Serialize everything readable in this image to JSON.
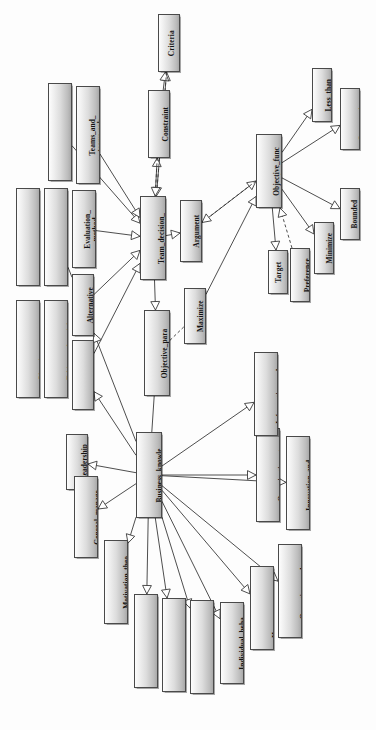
{
  "diagram": {
    "orientation": "rotated-90-ccw",
    "style": {
      "node_border": "#4a4a4a",
      "node_fill_light": "#fdfdfd",
      "node_fill_dark": "#a9a9a9",
      "edge_color": "#3a3a3a",
      "background": "#fdfdfd"
    },
    "expander_glyph": "+",
    "nodes": [
      {
        "id": "criteria",
        "label": "Criteria",
        "x": 158,
        "y": 14,
        "w": 22,
        "h": 58,
        "expander": true
      },
      {
        "id": "constraint",
        "label": "Constraint",
        "x": 148,
        "y": 90,
        "w": 22,
        "h": 68,
        "expander": true
      },
      {
        "id": "strategy",
        "label": "Strategy_and_st\nrategic_managem...",
        "x": 48,
        "y": 83,
        "w": 24,
        "h": 98,
        "expander": true
      },
      {
        "id": "teams",
        "label": "Teams_and_\nteamwork",
        "x": 76,
        "y": 86,
        "w": 24,
        "h": 98,
        "expander": true
      },
      {
        "id": "communication",
        "label": "Communication_\nand_collaboration...",
        "x": 16,
        "y": 188,
        "w": 24,
        "h": 98,
        "expander": true
      },
      {
        "id": "control",
        "label": "Control_processes_\nand_systems",
        "x": 44,
        "y": 188,
        "w": 24,
        "h": 98,
        "expander": true
      },
      {
        "id": "evaluation",
        "label": "Evaluation_\nmethod",
        "x": 72,
        "y": 190,
        "w": 24,
        "h": 78,
        "expander": true
      },
      {
        "id": "planning",
        "label": "Planning_process_\nand_technique...",
        "x": 16,
        "y": 300,
        "w": 24,
        "h": 98,
        "expander": true
      },
      {
        "id": "ethics",
        "label": "Ethics_and_social_\nresponsibil...",
        "x": 44,
        "y": 300,
        "w": 24,
        "h": 98,
        "expander": true
      },
      {
        "id": "alternative",
        "label": "Alternative",
        "x": 72,
        "y": 274,
        "w": 22,
        "h": 62,
        "expander": true
      },
      {
        "id": "related_models",
        "label": "Related_models",
        "x": 72,
        "y": 340,
        "w": 22,
        "h": 70,
        "expander": true
      },
      {
        "id": "team_decision",
        "label": "Team_decision_\nmaking",
        "x": 140,
        "y": 196,
        "w": 26,
        "h": 84,
        "expander": false
      },
      {
        "id": "argument",
        "label": "Argument",
        "x": 180,
        "y": 200,
        "w": 22,
        "h": 62,
        "expander": true
      },
      {
        "id": "objective_param",
        "label": "Objective_para\nmeter",
        "x": 144,
        "y": 310,
        "w": 26,
        "h": 86,
        "expander": true
      },
      {
        "id": "maximize",
        "label": "Maximize",
        "x": 184,
        "y": 288,
        "w": 22,
        "h": 56,
        "expander": true
      },
      {
        "id": "objective_func",
        "label": "Objective_func\ntion",
        "x": 256,
        "y": 134,
        "w": 26,
        "h": 74,
        "expander": false
      },
      {
        "id": "less_than",
        "label": "Less_than",
        "x": 312,
        "y": 68,
        "w": 20,
        "h": 54,
        "expander": false
      },
      {
        "id": "greater_than",
        "label": "Greater_than",
        "x": 340,
        "y": 88,
        "w": 20,
        "h": 62,
        "expander": false
      },
      {
        "id": "bounded",
        "label": "Bounded",
        "x": 340,
        "y": 188,
        "w": 20,
        "h": 52,
        "expander": false
      },
      {
        "id": "minimize",
        "label": "Minimize",
        "x": 314,
        "y": 222,
        "w": 20,
        "h": 52,
        "expander": false
      },
      {
        "id": "target",
        "label": "Target",
        "x": 268,
        "y": 250,
        "w": 20,
        "h": 44,
        "expander": false
      },
      {
        "id": "preference",
        "label": "Preference",
        "x": 290,
        "y": 248,
        "w": 20,
        "h": 54,
        "expander": true
      },
      {
        "id": "business",
        "label": "Business_knowle\ndge",
        "x": 136,
        "y": 432,
        "w": 26,
        "h": 86,
        "expander": false
      },
      {
        "id": "leadership",
        "label": "Leadership",
        "x": 66,
        "y": 434,
        "w": 22,
        "h": 56,
        "expander": true
      },
      {
        "id": "general_mgmt",
        "label": "General_manage\nment",
        "x": 74,
        "y": 476,
        "w": 24,
        "h": 82,
        "expander": true
      },
      {
        "id": "motivation",
        "label": "Motivation_theo\nry_and_practice",
        "x": 104,
        "y": 540,
        "w": 24,
        "h": 84,
        "expander": true
      },
      {
        "id": "mgmt_learning",
        "label": "Management_learning_\npast_&_pre...",
        "x": 134,
        "y": 594,
        "w": 24,
        "h": 94,
        "expander": true
      },
      {
        "id": "global_dim",
        "label": "Global_dimensions_\nof_management...",
        "x": 162,
        "y": 598,
        "w": 24,
        "h": 94,
        "expander": true
      },
      {
        "id": "environmental",
        "label": "Environmental_and_\norganization...",
        "x": 190,
        "y": 600,
        "w": 24,
        "h": 94,
        "expander": true
      },
      {
        "id": "individual",
        "label": "Individual_beha\nvior",
        "x": 220,
        "y": 602,
        "w": 24,
        "h": 82,
        "expander": true
      },
      {
        "id": "human_resource",
        "label": "Human_resource_\nmanagement",
        "x": 250,
        "y": 566,
        "w": 24,
        "h": 84,
        "expander": true
      },
      {
        "id": "operations",
        "label": "Operations_and_\nservices_manage...",
        "x": 278,
        "y": 544,
        "w": 24,
        "h": 94,
        "expander": true
      },
      {
        "id": "organization_st",
        "label": "Organization_st\nructures_and_de...",
        "x": 256,
        "y": 428,
        "w": 24,
        "h": 94,
        "expander": true
      },
      {
        "id": "innovation",
        "label": "Innovation_and_\norganizational_...",
        "x": 286,
        "y": 436,
        "w": 24,
        "h": 94,
        "expander": true
      },
      {
        "id": "information",
        "label": "Information_and_\ndecision_makin...",
        "x": 254,
        "y": 352,
        "w": 24,
        "h": 84,
        "expander": true
      }
    ],
    "edges": [
      {
        "from": "team_decision",
        "to": "criteria",
        "kind": "solid",
        "arrow": "hollow-triangle"
      },
      {
        "from": "team_decision",
        "to": "constraint",
        "kind": "solid",
        "arrow": "hollow-triangle"
      },
      {
        "from": "constraint",
        "to": "criteria",
        "kind": "solid",
        "arrow": "hollow-triangle"
      },
      {
        "from": "criteria",
        "to": "team_decision",
        "kind": "dashed",
        "arrow": "hollow-triangle"
      },
      {
        "from": "constraint",
        "to": "team_decision",
        "kind": "dashed",
        "arrow": "hollow-triangle"
      },
      {
        "from": "strategy",
        "to": "team_decision",
        "kind": "solid",
        "arrow": "hollow-triangle"
      },
      {
        "from": "teams",
        "to": "team_decision",
        "kind": "solid",
        "arrow": "hollow-triangle"
      },
      {
        "from": "evaluation",
        "to": "team_decision",
        "kind": "solid",
        "arrow": "hollow-triangle"
      },
      {
        "from": "control",
        "to": "alternative",
        "kind": "solid",
        "arrow": "none"
      },
      {
        "from": "alternative",
        "to": "team_decision",
        "kind": "solid",
        "arrow": "hollow-triangle"
      },
      {
        "from": "related_models",
        "to": "team_decision",
        "kind": "solid",
        "arrow": "hollow-triangle"
      },
      {
        "from": "team_decision",
        "to": "argument",
        "kind": "solid",
        "arrow": "hollow-triangle"
      },
      {
        "from": "team_decision",
        "to": "objective_param",
        "kind": "solid",
        "arrow": "hollow-triangle"
      },
      {
        "from": "argument",
        "to": "objective_func",
        "kind": "solid",
        "arrow": "hollow-triangle"
      },
      {
        "from": "objective_func",
        "to": "argument",
        "kind": "dashed",
        "arrow": "hollow-triangle"
      },
      {
        "from": "maximize",
        "to": "objective_func",
        "kind": "solid",
        "arrow": "hollow-triangle"
      },
      {
        "from": "objective_param",
        "to": "maximize",
        "kind": "dashed",
        "arrow": "none"
      },
      {
        "from": "objective_func",
        "to": "less_than",
        "kind": "solid",
        "arrow": "hollow-triangle"
      },
      {
        "from": "objective_func",
        "to": "greater_than",
        "kind": "solid",
        "arrow": "hollow-triangle"
      },
      {
        "from": "objective_func",
        "to": "bounded",
        "kind": "solid",
        "arrow": "hollow-triangle"
      },
      {
        "from": "objective_func",
        "to": "minimize",
        "kind": "solid",
        "arrow": "hollow-triangle"
      },
      {
        "from": "objective_func",
        "to": "target",
        "kind": "solid",
        "arrow": "hollow-triangle"
      },
      {
        "from": "preference",
        "to": "objective_func",
        "kind": "dashed",
        "arrow": "hollow-triangle"
      },
      {
        "from": "business",
        "to": "related_models",
        "kind": "solid",
        "arrow": "hollow-triangle"
      },
      {
        "from": "business",
        "to": "alternative",
        "kind": "solid",
        "arrow": "hollow-triangle"
      },
      {
        "from": "business",
        "to": "leadership",
        "kind": "solid",
        "arrow": "hollow-triangle"
      },
      {
        "from": "business",
        "to": "general_mgmt",
        "kind": "solid",
        "arrow": "hollow-triangle"
      },
      {
        "from": "business",
        "to": "motivation",
        "kind": "solid",
        "arrow": "hollow-triangle"
      },
      {
        "from": "business",
        "to": "mgmt_learning",
        "kind": "solid",
        "arrow": "hollow-triangle"
      },
      {
        "from": "business",
        "to": "global_dim",
        "kind": "solid",
        "arrow": "hollow-triangle"
      },
      {
        "from": "business",
        "to": "environmental",
        "kind": "solid",
        "arrow": "hollow-triangle"
      },
      {
        "from": "business",
        "to": "individual",
        "kind": "solid",
        "arrow": "hollow-triangle"
      },
      {
        "from": "business",
        "to": "human_resource",
        "kind": "solid",
        "arrow": "hollow-triangle"
      },
      {
        "from": "business",
        "to": "operations",
        "kind": "solid",
        "arrow": "hollow-triangle"
      },
      {
        "from": "business",
        "to": "organization_st",
        "kind": "solid",
        "arrow": "hollow-triangle"
      },
      {
        "from": "business",
        "to": "innovation",
        "kind": "solid",
        "arrow": "hollow-triangle"
      },
      {
        "from": "business",
        "to": "information",
        "kind": "solid",
        "arrow": "hollow-triangle"
      },
      {
        "from": "objective_param",
        "to": "business",
        "kind": "solid",
        "arrow": "none"
      }
    ]
  }
}
